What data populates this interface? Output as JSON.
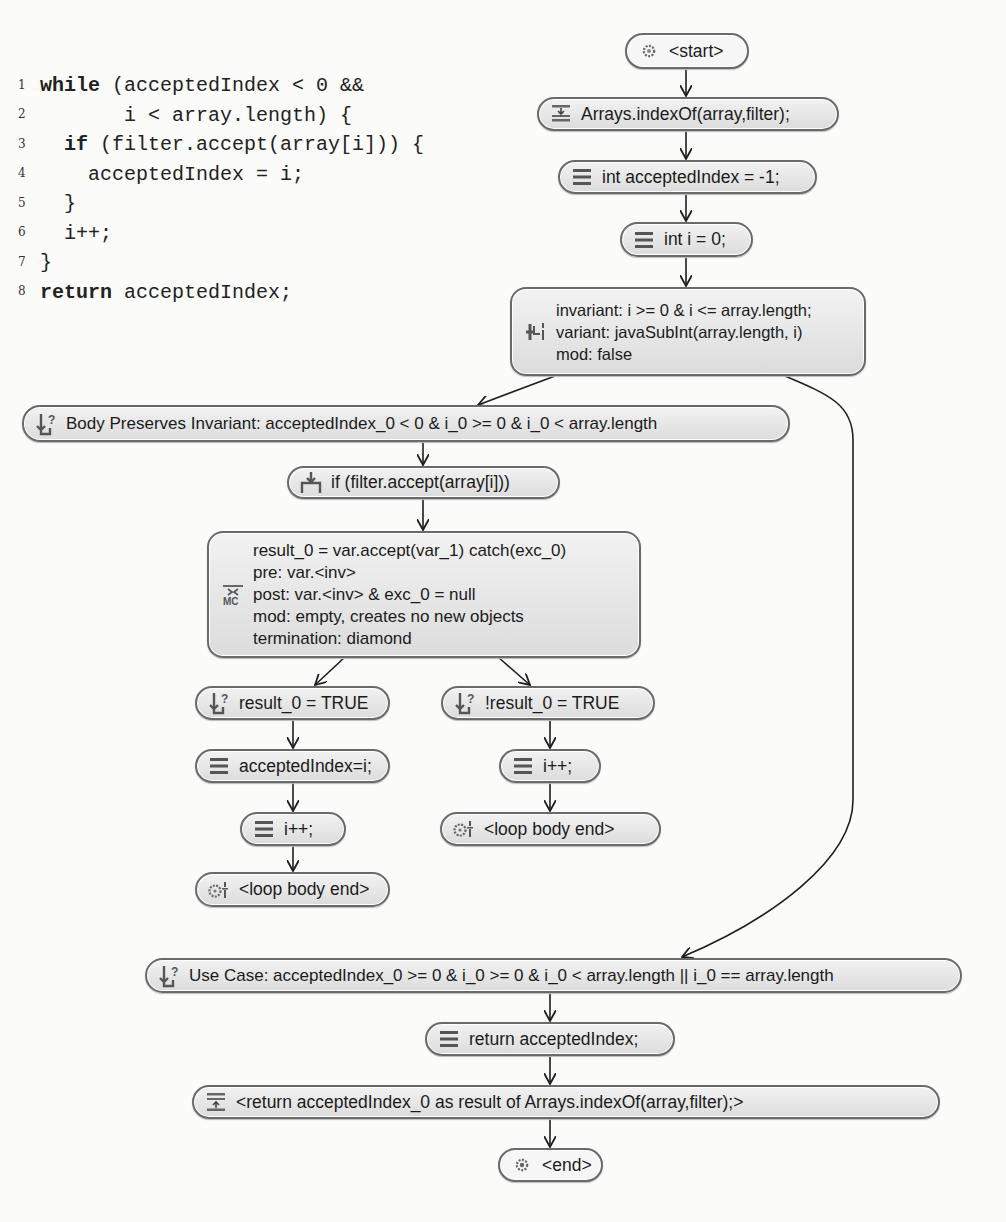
{
  "code": {
    "lines": [
      {
        "num": "1",
        "keyword": "while",
        "text": " (acceptedIndex < 0 &&"
      },
      {
        "num": "2",
        "keyword": "",
        "text": "       i < array.length) {"
      },
      {
        "num": "3",
        "keyword": "if",
        "text": " (filter.accept(array[i])) {",
        "indent": "  "
      },
      {
        "num": "4",
        "keyword": "",
        "text": "    acceptedIndex = i;"
      },
      {
        "num": "5",
        "keyword": "",
        "text": "  }"
      },
      {
        "num": "6",
        "keyword": "",
        "text": "  i++;"
      },
      {
        "num": "7",
        "keyword": "",
        "text": "}"
      },
      {
        "num": "8",
        "keyword": "return",
        "text": " acceptedIndex;"
      }
    ]
  },
  "flow": {
    "start": {
      "label": "<start>",
      "icon": "gear-icon"
    },
    "call": {
      "label": "Arrays.indexOf(array,filter);",
      "icon": "method-call-icon"
    },
    "init_accepted": {
      "label": "int acceptedIndex = -1;",
      "icon": "statement-icon"
    },
    "init_i": {
      "label": "int i = 0;",
      "icon": "statement-icon"
    },
    "loop_invariant": {
      "icon": "loop-invariant-icon",
      "lines": [
        "invariant: i >= 0 & i <= array.length;",
        "variant: javaSubInt(array.length, i)",
        "mod: false"
      ]
    },
    "body_preserves": {
      "label": "Body Preserves Invariant: acceptedIndex_0 < 0 & i_0 >= 0 &  i_0 < array.length",
      "icon": "branch-condition-icon"
    },
    "if_stmt": {
      "label": "if (filter.accept(array[i]))",
      "icon": "branch-statement-icon"
    },
    "method_contract": {
      "icon": "method-contract-icon",
      "lines": [
        "result_0 = var.accept(var_1) catch(exc_0)",
        "pre: var.<inv>",
        "post: var.<inv> & exc_0 = null",
        "mod: empty, creates no new objects",
        "termination: diamond"
      ]
    },
    "cond_true": {
      "label": "result_0 = TRUE",
      "icon": "branch-condition-icon"
    },
    "cond_false": {
      "label": "!result_0 = TRUE",
      "icon": "branch-condition-icon"
    },
    "assign": {
      "label": "acceptedIndex=i;",
      "icon": "statement-icon"
    },
    "inc_left": {
      "label": "i++;",
      "icon": "statement-icon"
    },
    "inc_right": {
      "label": "i++;",
      "icon": "statement-icon"
    },
    "loop_end_right": {
      "label": "<loop body end>",
      "icon": "loop-body-end-icon"
    },
    "loop_end_left": {
      "label": "<loop body end>",
      "icon": "loop-body-end-icon"
    },
    "use_case": {
      "label": "Use Case: acceptedIndex_0 >= 0 & i_0 >= 0 & i_0 < array.length || i_0 == array.length",
      "icon": "branch-condition-icon"
    },
    "return_stmt": {
      "label": "return acceptedIndex;",
      "icon": "statement-icon"
    },
    "method_return": {
      "label": "<return acceptedIndex_0 as result of Arrays.indexOf(array,filter);>",
      "icon": "method-return-icon"
    },
    "end": {
      "label": "<end>",
      "icon": "end-icon"
    }
  },
  "colors": {
    "node_border": "#6a6a6a",
    "node_fill": "#e6e6e6",
    "edge": "#1e1e1e",
    "text": "#1b1b1b",
    "background": "#fbfbfa"
  }
}
